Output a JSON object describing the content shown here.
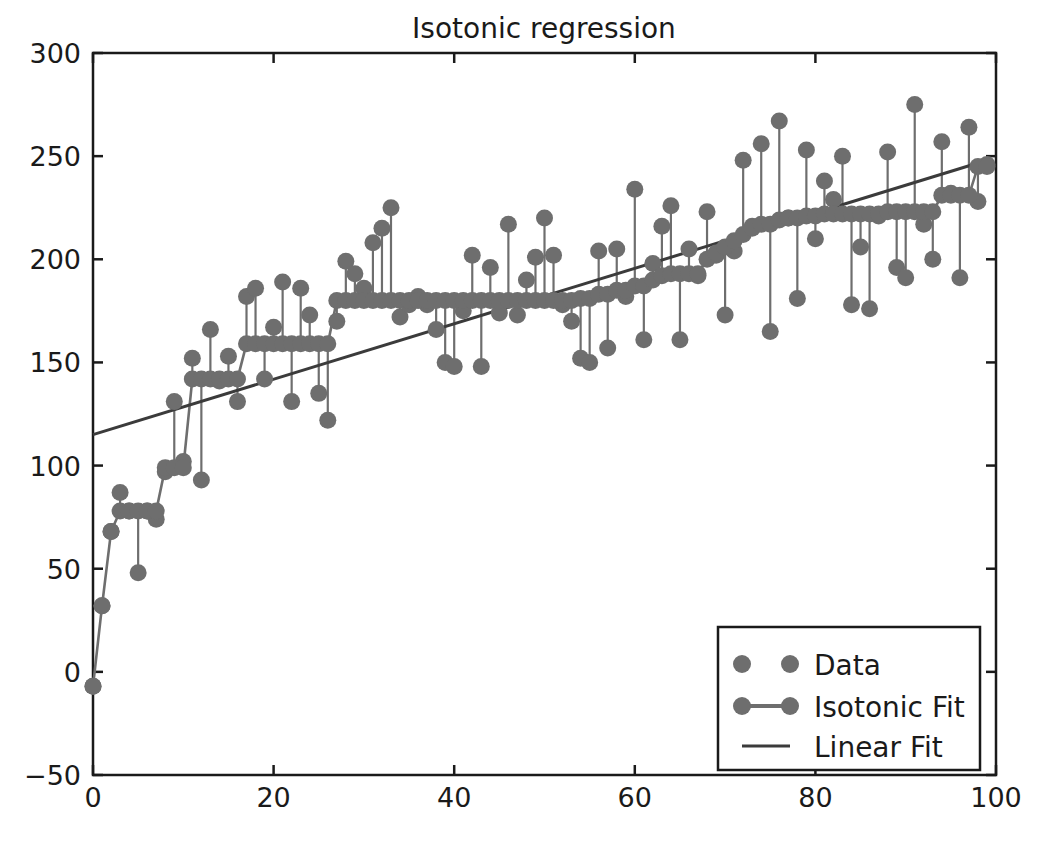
{
  "chart_data": {
    "type": "scatter",
    "title": "Isotonic regression",
    "xlabel": "",
    "ylabel": "",
    "xlim": [
      0,
      100
    ],
    "ylim": [
      -50,
      300
    ],
    "xticks": [
      0,
      20,
      40,
      60,
      80,
      100
    ],
    "yticks": [
      -50,
      0,
      50,
      100,
      150,
      200,
      250,
      300
    ],
    "grid": false,
    "legend_position": "lower right",
    "colors": {
      "marker": "#6e6e6e",
      "isotonic_line": "#6e6e6e",
      "linear_line": "#3b3b3b",
      "axes": "#1a1a1a",
      "background": "#ffffff"
    },
    "legend": [
      {
        "label": "Data",
        "marker": "circle",
        "line": false
      },
      {
        "label": "Isotonic Fit",
        "marker": "circle",
        "line": true
      },
      {
        "label": "Linear Fit",
        "marker": "none",
        "line": true
      }
    ],
    "series": [
      {
        "name": "Data",
        "marker": "circle",
        "x": [
          0,
          1,
          2,
          3,
          4,
          5,
          6,
          7,
          8,
          9,
          10,
          11,
          12,
          13,
          14,
          15,
          16,
          17,
          18,
          19,
          20,
          21,
          22,
          23,
          24,
          25,
          26,
          27,
          28,
          29,
          30,
          31,
          32,
          33,
          34,
          35,
          36,
          37,
          38,
          39,
          40,
          41,
          42,
          43,
          44,
          45,
          46,
          47,
          48,
          49,
          50,
          51,
          52,
          53,
          54,
          55,
          56,
          57,
          58,
          59,
          60,
          61,
          62,
          63,
          64,
          65,
          66,
          67,
          68,
          69,
          70,
          71,
          72,
          73,
          74,
          75,
          76,
          77,
          78,
          79,
          80,
          81,
          82,
          83,
          84,
          85,
          86,
          87,
          88,
          89,
          90,
          91,
          92,
          93,
          94,
          95,
          96,
          97,
          98,
          99
        ],
        "y": [
          -7,
          32,
          68,
          87,
          78,
          48,
          78,
          74,
          97,
          131,
          102,
          152,
          93,
          166,
          141,
          153,
          131,
          182,
          186,
          142,
          167,
          189,
          131,
          186,
          173,
          135,
          122,
          170,
          199,
          193,
          186,
          208,
          215,
          225,
          172,
          178,
          182,
          178,
          166,
          150,
          148,
          175,
          202,
          148,
          196,
          174,
          217,
          173,
          190,
          201,
          220,
          202,
          178,
          170,
          152,
          150,
          204,
          157,
          205,
          182,
          234,
          161,
          198,
          216,
          226,
          161,
          205,
          192,
          223,
          202,
          173,
          204,
          248,
          216,
          256,
          165,
          267,
          220,
          181,
          253,
          210,
          238,
          229,
          250,
          178,
          206,
          176,
          221,
          252,
          196,
          191,
          275,
          217,
          200,
          257,
          232,
          191,
          264,
          228,
          246
        ]
      },
      {
        "name": "Isotonic Fit",
        "marker": "circle",
        "x": [
          0,
          1,
          2,
          3,
          4,
          5,
          6,
          7,
          8,
          9,
          10,
          11,
          12,
          13,
          14,
          15,
          16,
          17,
          18,
          19,
          20,
          21,
          22,
          23,
          24,
          25,
          26,
          27,
          28,
          29,
          30,
          31,
          32,
          33,
          34,
          35,
          36,
          37,
          38,
          39,
          40,
          41,
          42,
          43,
          44,
          45,
          46,
          47,
          48,
          49,
          50,
          51,
          52,
          53,
          54,
          55,
          56,
          57,
          58,
          59,
          60,
          61,
          62,
          63,
          64,
          65,
          66,
          67,
          68,
          69,
          70,
          71,
          72,
          73,
          74,
          75,
          76,
          77,
          78,
          79,
          80,
          81,
          82,
          83,
          84,
          85,
          86,
          87,
          88,
          89,
          90,
          91,
          92,
          93,
          94,
          95,
          96,
          97,
          98,
          99
        ],
        "y": [
          -7,
          32,
          68,
          78,
          78,
          78,
          78,
          78,
          99,
          99,
          99,
          142,
          142,
          142,
          142,
          142,
          142,
          159,
          159,
          159,
          159,
          159,
          159,
          159,
          159,
          159,
          159,
          180,
          180,
          180,
          180,
          180,
          180,
          180,
          180,
          180,
          180,
          180,
          180,
          180,
          180,
          180,
          180,
          180,
          180,
          180,
          180,
          180,
          180,
          180,
          180,
          180,
          180,
          180,
          181,
          181,
          183,
          183,
          185,
          185,
          187,
          187,
          190,
          192,
          193,
          193,
          193,
          193,
          200,
          203,
          206,
          209,
          212,
          215,
          217,
          217,
          219,
          220,
          220,
          221,
          221,
          222,
          222,
          222,
          222,
          222,
          222,
          222,
          223,
          223,
          223,
          223,
          223,
          223,
          231,
          231,
          231,
          231,
          245,
          245
        ]
      },
      {
        "name": "Linear Fit",
        "marker": "none",
        "x": [
          0,
          99
        ],
        "y": [
          115,
          248
        ]
      }
    ]
  }
}
